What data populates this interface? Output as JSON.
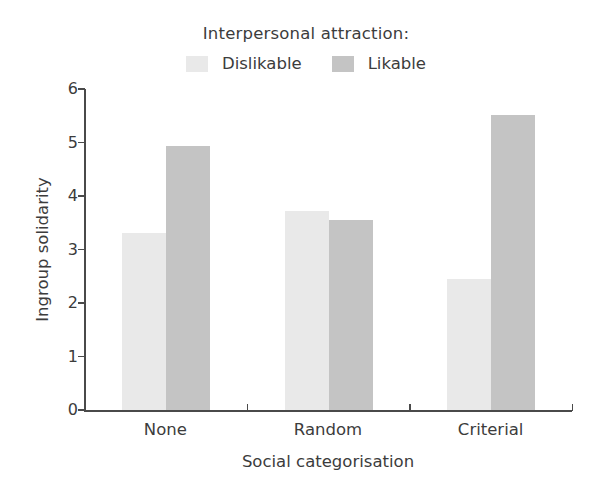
{
  "chart_data": {
    "type": "bar",
    "title": "",
    "xlabel": "Social categorisation",
    "ylabel": "Ingroup solidarity",
    "categories": [
      "None",
      "Random",
      "Criterial"
    ],
    "series": [
      {
        "name": "Dislikable",
        "values": [
          3.3,
          3.72,
          2.45
        ],
        "color": "#e9e9e9"
      },
      {
        "name": "Likable",
        "values": [
          4.93,
          3.55,
          5.51
        ],
        "color": "#c4c4c4"
      }
    ],
    "ylim": [
      0,
      6
    ],
    "ytick_labels": [
      "0",
      "1",
      "2",
      "3",
      "4",
      "5",
      "6"
    ],
    "yticks": [
      0,
      1,
      2,
      3,
      4,
      5,
      6
    ],
    "grid": false,
    "legend_position": "top-center",
    "legend_title": "Interpersonal attraction:"
  },
  "legend": {
    "title": "Interpersonal attraction:",
    "items": [
      {
        "label": "Dislikable",
        "color": "#e9e9e9"
      },
      {
        "label": "Likable",
        "color": "#c4c4c4"
      }
    ]
  },
  "axes": {
    "y_title": "Ingroup solidarity",
    "x_title": "Social categorisation",
    "y_labels": [
      "6",
      "5",
      "4",
      "3",
      "2",
      "1",
      "0"
    ],
    "x_labels": [
      "None",
      "Random",
      "Criterial"
    ]
  },
  "colors": {
    "axis": "#4a4a4a",
    "text": "#3c3c3c",
    "background": "#ffffff",
    "bar_light": "#e9e9e9",
    "bar_dark": "#c4c4c4"
  }
}
